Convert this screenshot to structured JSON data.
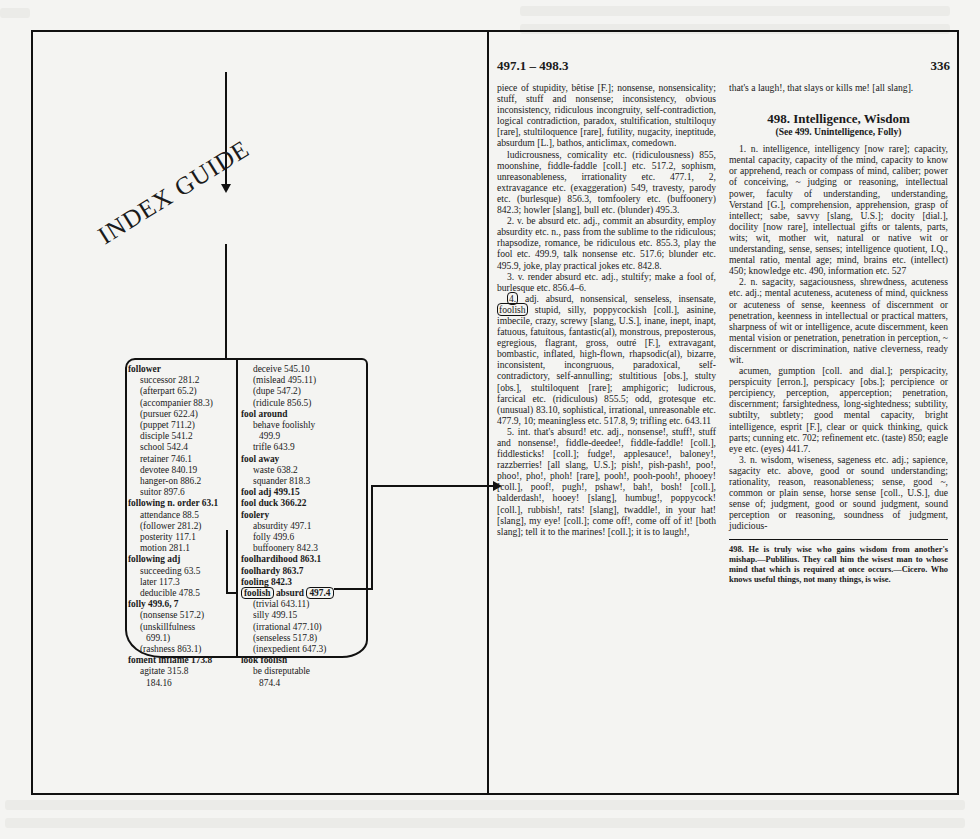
{
  "diagram": {
    "label": "INDEX GUIDE",
    "index_left_column": [
      {
        "text": "follower",
        "style": "head"
      },
      {
        "text": "successor 281.2",
        "style": "sub"
      },
      {
        "text": "(afterpart 65.2)",
        "style": "sub"
      },
      {
        "text": "(accompanier 88.3)",
        "style": "sub"
      },
      {
        "text": "(pursuer 622.4)",
        "style": "sub"
      },
      {
        "text": "(puppet 711.2)",
        "style": "sub"
      },
      {
        "text": "disciple 541.2",
        "style": "sub"
      },
      {
        "text": "school 542.4",
        "style": "sub"
      },
      {
        "text": "retainer 746.1",
        "style": "sub"
      },
      {
        "text": "devotee 840.19",
        "style": "sub"
      },
      {
        "text": "hanger-on 886.2",
        "style": "sub"
      },
      {
        "text": "suitor 897.6",
        "style": "sub"
      },
      {
        "text": "following n. order 63.1",
        "style": "head"
      },
      {
        "text": "attendance 88.5",
        "style": "sub"
      },
      {
        "text": "(follower 281.2)",
        "style": "sub"
      },
      {
        "text": "posterity 117.1",
        "style": "sub"
      },
      {
        "text": "motion 281.1",
        "style": "sub"
      },
      {
        "text": "following adj",
        "style": "head"
      },
      {
        "text": "succeeding 63.5",
        "style": "sub"
      },
      {
        "text": "later 117.3",
        "style": "sub"
      },
      {
        "text": "deducible 478.5",
        "style": "sub"
      },
      {
        "text": "folly 499.6, 7",
        "style": "head"
      },
      {
        "text": "(nonsense 517.2)",
        "style": "sub"
      },
      {
        "text": "(unskillfulness",
        "style": "sub"
      },
      {
        "text": "699.1)",
        "style": "sub2"
      },
      {
        "text": "(rashness 863.1)",
        "style": "sub"
      },
      {
        "text": "foment inflame 173.8",
        "style": "head"
      },
      {
        "text": "agitate 315.8",
        "style": "sub"
      },
      {
        "text": "184.16",
        "style": "sub2"
      }
    ],
    "index_right_column": [
      {
        "text": "deceive 545.10",
        "style": "sub"
      },
      {
        "text": "(mislead 495.11)",
        "style": "sub"
      },
      {
        "text": "(dupe 547.2)",
        "style": "sub"
      },
      {
        "text": "(ridicule 856.5)",
        "style": "sub"
      },
      {
        "text": "fool around",
        "style": "head"
      },
      {
        "text": "behave foolishly",
        "style": "sub"
      },
      {
        "text": "499.9",
        "style": "sub2"
      },
      {
        "text": "trifle 643.9",
        "style": "sub"
      },
      {
        "text": "fool away",
        "style": "head"
      },
      {
        "text": "waste 638.2",
        "style": "sub"
      },
      {
        "text": "squander 818.3",
        "style": "sub"
      },
      {
        "text": "fool adj 499.15",
        "style": "head"
      },
      {
        "text": "fool duck 366.22",
        "style": "head"
      },
      {
        "text": "foolery",
        "style": "head"
      },
      {
        "text": "absurdity 497.1",
        "style": "sub"
      },
      {
        "text": "folly 499.6",
        "style": "sub"
      },
      {
        "text": "buffoonery 842.3",
        "style": "sub"
      },
      {
        "text": "foolhardihood 863.1",
        "style": "head"
      },
      {
        "text": "foolhardy 863.7",
        "style": "head"
      },
      {
        "text": "fooling 842.3",
        "style": "head"
      },
      {
        "text": "foolish absurd 497.4",
        "style": "head-boxed",
        "word": "foolish",
        "middle": " absurd ",
        "ref": "497.4"
      },
      {
        "text": "(trivial 643.11)",
        "style": "sub"
      },
      {
        "text": "silly 499.15",
        "style": "sub"
      },
      {
        "text": "(irrational 477.10)",
        "style": "sub"
      },
      {
        "text": "(senseless 517.8)",
        "style": "sub"
      },
      {
        "text": "(inexpedient 647.3)",
        "style": "sub"
      },
      {
        "text": "look foolish",
        "style": "head"
      },
      {
        "text": "be disreputable",
        "style": "sub"
      },
      {
        "text": "874.4",
        "style": "sub2"
      }
    ]
  },
  "page": {
    "range": "497.1 – 498.3",
    "number": "336",
    "left_column": {
      "p1": "piece of stupidity, bêtise [F.]; nonsense, nonsensicality; stuff, stuff and nonsense; inconsistency, obvious inconsistency, ridiculous incongruity, self-contradiction, logical contradiction, paradox, stultification, stultiloquy [rare], stultiloquence [rare], futility, nugacity, ineptitude, absurdum [L.], bathos, anticlimax, comedown.",
      "p2": "ludicrousness, comicality etc. (ridiculousness) 855, moonshine, fiddle-faddle [coll.] etc. 517.2, sophism, unreasonableness, irrationality etc. 477.1, 2, extravagance etc. (exaggeration) 549, travesty, parody etc. (burlesque) 856.3, tomfoolery etc. (buffoonery) 842.3; howler [slang], bull etc. (blunder) 495.3.",
      "p3": "2. v. be absurd etc. adj., commit an absurdity, employ absurdity etc. n., pass from the sublime to the ridiculous; rhapsodize, romance, be ridiculous etc. 855.3, play the fool etc. 499.9, talk nonsense etc. 517.6; blunder etc. 495.9, joke, play practical jokes etc. 842.8.",
      "p4": "3. v. render absurd etc. adj., stultify; make a fool of, burlesque etc. 856.4–6.",
      "p5_num": "4.",
      "p5_a": " adj. absurd, nonsensical, senseless, insensate, ",
      "p5_boxed": "foolish",
      "p5_b": " stupid, silly, poppycockish [coll.], asinine, imbecile, crazy, screwy [slang, U.S.], inane, inept, inapt, fatuous, fatuitous, fantastic(al), monstrous, preposterous, egregious, flagrant, gross, outré [F.], extravagant, bombastic, inflated, high-flown, rhapsodic(al), bizarre, inconsistent, incongruous, paradoxical, self-contradictory, self-annulling; stultitious [obs.], stulty [obs.], stultiloquent [rare]; amphigoric; ludicrous, farcical etc. (ridiculous) 855.5; odd, grotesque etc. (unusual) 83.10, sophistical, irrational, unreasonable etc. 477.9, 10; meaningless etc. 517.8, 9; trifling etc. 643.11",
      "p6": "5. int. that's absurd! etc. adj., nonsense!, stuff!, stuff and nonsense!, fiddle-deedee!, fiddle-faddle! [coll.], fiddlesticks! [coll.]; fudge!, applesauce!, baloney!, razzberries! [all slang, U.S.]; pish!, pish-pash!, poo!, phoo!, pho!, phoh! [rare], pooh!, pooh-pooh!, phooey! [coll.], poof!, pugh!, pshaw!, bah!, bosh! [coll.], balderdash!, hooey! [slang], humbug!, poppycock! [coll.], rubbish!, rats! [slang], twaddle!, in your hat! [slang], my eye! [coll.]; come off!, come off of it! [both slang]; tell it to the marines! [coll.]; it is to laugh!,"
    },
    "right_column": {
      "cont": "that's a laugh!, that slays or kills me! [all slang].",
      "section_title": "498. Intelligence, Wisdom",
      "section_see": "(See 499. Unintelligence, Folly)",
      "p1": "1. n. intelligence, intelligency [now rare]; capacity, mental capacity, capacity of the mind, capacity to know or apprehend, reach or compass of mind, caliber; power of conceiving, ~ judging or reasoning, intellectual power, faculty of understanding, understanding, Verstand [G.], comprehension, apprehension, grasp of intellect; sabe, savvy [slang, U.S.]; docity [dial.], docility [now rare], intellectual gifts or talents, parts, wits; wit, mother wit, natural or native wit or understanding, sense, senses; intelligence quotient, I.Q., mental ratio, mental age; mind, brains etc. (intellect) 450; knowledge etc. 490, information etc. 527",
      "p2": "2. n. sagacity, sagaciousness, shrewdness, acuteness etc. adj.; mental acuteness, acuteness of mind, quickness or acuteness of sense, keenness of discernment or penetration, keenness in intellectual or practical matters, sharpness of wit or intelligence, acute discernment, keen mental vision or penetration, penetration in perception, ~ discernment or discrimination, native cleverness, ready wit.",
      "p3": "acumen, gumption [coll. and dial.]; perspicacity, perspicuity [erron.], perspicacy [obs.]; percipience or percipiency, perception, apperception; penetration, discernment; farsightedness, long-sightedness; subtility, subtilty, subtlety; good mental capacity, bright intelligence, esprit [F.], clear or quick thinking, quick parts; cunning etc. 702; refinement etc. (taste) 850; eagle eye etc. (eyes) 441.7.",
      "p4": "3. n. wisdom, wiseness, sageness etc. adj.; sapience, sagacity etc. above, good or sound understanding; rationality, reason, reasonableness; sense, good ~, common or plain sense, horse sense [coll., U.S.], due sense of; judgment, good or sound judgment, sound perception or reasoning, soundness of judgment, judicious-",
      "footnote": "498. He is truly wise who gains wisdom from another's mishap.—Publilius. They call him the wisest man to whose mind that which is required at once occurs.—Cicero. Who knows useful things, not many things, is wise."
    }
  },
  "colors": {
    "paper": "#f4f4f2",
    "ink": "#111111",
    "bleed": "#e4e4e0"
  }
}
